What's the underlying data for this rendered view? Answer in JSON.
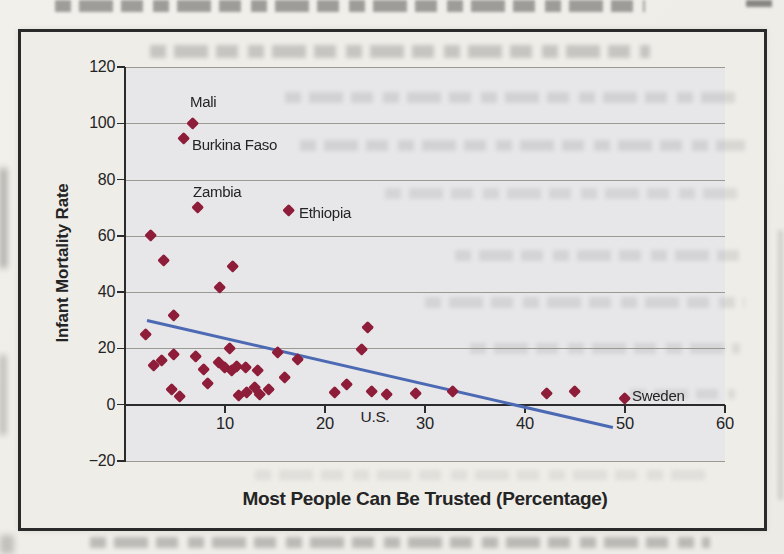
{
  "figure": {
    "kind": "scanned textbook scatter-plot figure",
    "border_color": "#2a2a2a",
    "paper_color": "#efede8"
  },
  "chart_data": {
    "type": "scatter",
    "title": "",
    "xlabel": "Most People Can Be Trusted (Percentage)",
    "ylabel": "Infant Mortality Rate",
    "xlim": [
      0,
      60
    ],
    "ylim": [
      -20,
      120
    ],
    "xticks": [
      10,
      20,
      30,
      40,
      50,
      60
    ],
    "xtick_labels": [
      "10",
      "20",
      "30",
      "40",
      "50",
      "60"
    ],
    "yticks": [
      120,
      100,
      80,
      60,
      40,
      20,
      0,
      -20
    ],
    "ytick_labels": [
      "120",
      "100",
      "80",
      "60",
      "40",
      "20",
      "0",
      "−20"
    ],
    "grid": "horizontal",
    "legend": "none",
    "marker": "diamond",
    "colors": {
      "marker": "#8e1d39",
      "trend_line": "#4c6ab4",
      "gridline": "#9b9994",
      "axis": "#2b2b2b",
      "plot_bg": "#e7e6e9",
      "text": "#242424"
    },
    "points": [
      [
        2.1,
        25
      ],
      [
        2.6,
        60
      ],
      [
        3.9,
        51
      ],
      [
        10.8,
        49
      ],
      [
        9.5,
        41.5
      ],
      [
        4.9,
        31.5
      ],
      [
        2.9,
        14
      ],
      [
        3.7,
        15.5
      ],
      [
        4.9,
        17.7
      ],
      [
        4.7,
        5.2
      ],
      [
        5.5,
        3
      ],
      [
        7.1,
        17
      ],
      [
        7.9,
        12.5
      ],
      [
        8.3,
        7.3
      ],
      [
        9.4,
        15
      ],
      [
        10.0,
        13.3
      ],
      [
        10.7,
        12
      ],
      [
        11.2,
        13.5
      ],
      [
        10.5,
        19.8
      ],
      [
        11.4,
        3.2
      ],
      [
        12.2,
        4.3
      ],
      [
        13.0,
        6.0
      ],
      [
        13.5,
        3.5
      ],
      [
        14.4,
        5.3
      ],
      [
        12.1,
        13.2
      ],
      [
        13.3,
        12
      ],
      [
        15.3,
        18.6
      ],
      [
        16.0,
        9.6
      ],
      [
        17.3,
        16.1
      ],
      [
        21.0,
        4.2
      ],
      [
        22.2,
        7.2
      ],
      [
        23.7,
        19.6
      ],
      [
        24.3,
        27.5
      ],
      [
        24.7,
        4.5
      ],
      [
        26.2,
        3.5
      ],
      [
        29.1,
        4.0
      ],
      [
        32.8,
        4.6
      ],
      [
        42.2,
        3.8
      ],
      [
        45.0,
        4.5
      ]
    ],
    "labeled_points": [
      {
        "label": "Mali",
        "x": 6.8,
        "y": 100,
        "label_dx": -3,
        "label_dy": -30
      },
      {
        "label": "Burkina Faso",
        "x": 5.9,
        "y": 94.7,
        "label_dx": 8,
        "label_dy": -2
      },
      {
        "label": "Zambia",
        "x": 7.3,
        "y": 70,
        "label_dx": -5,
        "label_dy": -25
      },
      {
        "label": "Ethiopia",
        "x": 16.4,
        "y": 68.9,
        "label_dx": 10,
        "label_dy": -7
      },
      {
        "label": "Sweden",
        "x": 50,
        "y": 2.2,
        "label_dx": 7,
        "label_dy": -12
      }
    ],
    "annotations": [
      {
        "text": "U.S.",
        "x": 25.0,
        "y": -4.4
      }
    ],
    "trend_line": {
      "x1": 2.2,
      "y1": 30,
      "x2": 48.8,
      "y2": -8
    }
  }
}
